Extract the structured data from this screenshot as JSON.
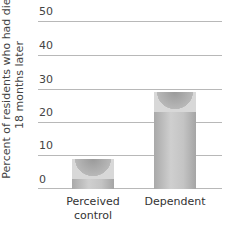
{
  "chart_data": {
    "type": "bar",
    "title": "",
    "xlabel": "",
    "ylabel": "Percent of residents who had died 18 months later",
    "ylabel_lines": [
      "Percent of residents who had died",
      "18 months later"
    ],
    "categories": [
      "Perceived control",
      "Dependent"
    ],
    "category_lines": [
      [
        "Perceived",
        "control"
      ],
      [
        "Dependent"
      ]
    ],
    "values": [
      9,
      29
    ],
    "ylim": [
      0,
      50
    ],
    "yticks": [
      0,
      10,
      20,
      30,
      40,
      50
    ],
    "grid": true,
    "legend": null
  },
  "ticks": [
    "50",
    "40",
    "30",
    "20",
    "10",
    "0"
  ]
}
